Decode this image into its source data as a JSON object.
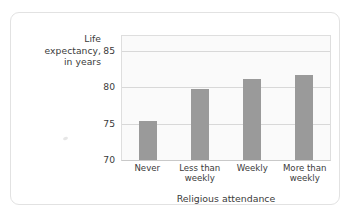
{
  "chart_data": {
    "type": "bar",
    "title": "",
    "categories": [
      "Never",
      "Less than weekly",
      "Weekly",
      "More than weekly"
    ],
    "category_lines": [
      [
        "Never"
      ],
      [
        "Less than",
        "weekly"
      ],
      [
        "Weekly"
      ],
      [
        "More than",
        "weekly"
      ]
    ],
    "values": [
      75.3,
      79.8,
      81.1,
      81.6
    ],
    "xlabel": "Religious attendance",
    "ylabel": "Life expectancy, in years",
    "ylabel_lines": [
      "Life",
      "expectancy,",
      "in years"
    ],
    "ylim": [
      70,
      87
    ],
    "yticks": [
      70,
      75,
      80,
      85
    ],
    "ytick_labels": [
      "70",
      "75",
      "80",
      "85"
    ],
    "grid": true,
    "legend": "none",
    "bar_color": "#9a9a9a",
    "plot_background": "#fafafa",
    "gridline_color": "#d8d8d8",
    "text_color": "#3b3b3b"
  }
}
